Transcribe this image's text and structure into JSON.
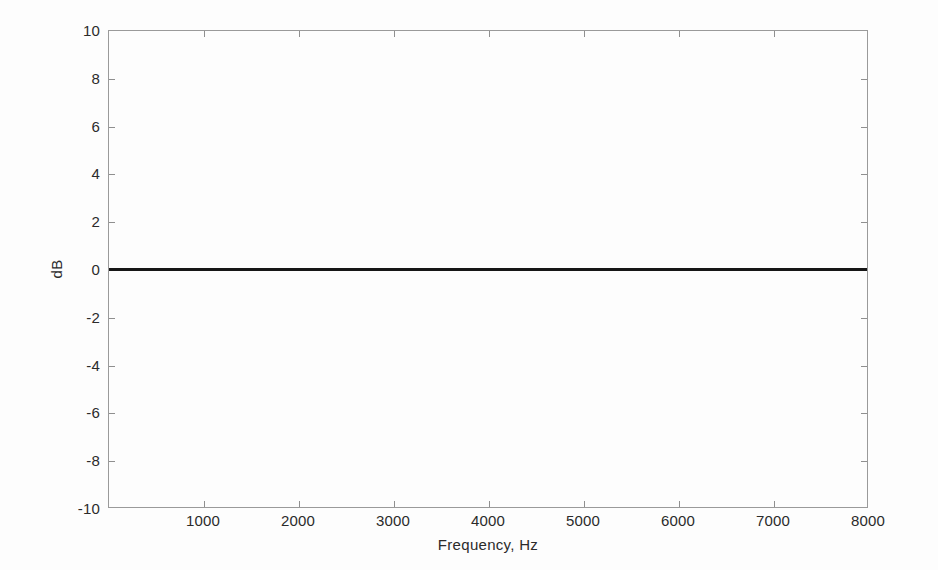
{
  "figure": {
    "background_color": "#fdfdfd",
    "axis_color": "#9a9a9a",
    "text_color": "#2b2b2b"
  },
  "chart_data": {
    "type": "line",
    "title": "",
    "xlabel": "Frequency, Hz",
    "ylabel": "dB",
    "xlim": [
      0,
      8000
    ],
    "ylim": [
      -10,
      10
    ],
    "grid": false,
    "legend": null,
    "xticks": [
      1000,
      2000,
      3000,
      4000,
      5000,
      6000,
      7000,
      8000
    ],
    "xticklabels": [
      "1000",
      "2000",
      "3000",
      "4000",
      "5000",
      "6000",
      "7000",
      "8000"
    ],
    "yticks": [
      -10,
      -8,
      -6,
      -4,
      -2,
      0,
      2,
      4,
      6,
      8,
      10
    ],
    "yticklabels": [
      "-10",
      "-8",
      "-6",
      "-4",
      "-2",
      "0",
      "2",
      "4",
      "6",
      "8",
      "10"
    ],
    "series": [
      {
        "name": "flat-response",
        "color": "#161616",
        "linewidth": 3,
        "x": [
          0,
          1000,
          2000,
          3000,
          4000,
          5000,
          6000,
          7000,
          8000
        ],
        "values": [
          0,
          0,
          0,
          0,
          0,
          0,
          0,
          0,
          0
        ]
      }
    ]
  }
}
